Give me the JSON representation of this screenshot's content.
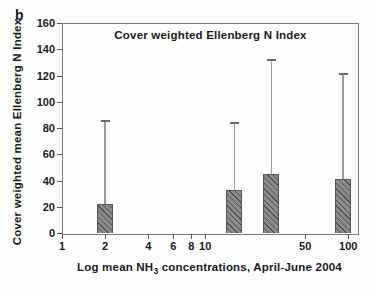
{
  "figure": {
    "panel_label": "b",
    "title": "Cover weighted Ellenberg N Index",
    "y_axis_label": "Cover weighted mean Ellenberg N Index",
    "x_axis_label_prefix": "Log mean NH",
    "x_axis_label_sub": "3",
    "x_axis_label_suffix": " concentrations, April-June 2004"
  },
  "chart_data": {
    "type": "bar",
    "title": "Cover weighted Ellenberg N Index",
    "xlabel": "Log mean NH3 concentrations, April-June 2004",
    "ylabel": "Cover weighted mean Ellenberg N Index",
    "x_scale": "log",
    "xlim": [
      1,
      115
    ],
    "ylim": [
      0,
      160
    ],
    "x_ticks": [
      1,
      2,
      4,
      6,
      8,
      10,
      50,
      100
    ],
    "y_ticks": [
      0,
      20,
      40,
      60,
      80,
      100,
      120,
      140,
      160
    ],
    "grid": false,
    "legend": null,
    "bar_width_px": 16,
    "bars": [
      {
        "x": 2,
        "mean": 22,
        "upper_error_top": 85
      },
      {
        "x": 16,
        "mean": 33,
        "upper_error_top": 84
      },
      {
        "x": 29,
        "mean": 45,
        "upper_error_top": 132
      },
      {
        "x": 92,
        "mean": 41,
        "upper_error_top": 121
      }
    ],
    "colors": {
      "bar_fill": "#8d8d8d",
      "bar_hatch": "#4f4f4f",
      "bar_border": "#555555",
      "error_line": "#9a9a9a",
      "error_cap": "#6a6a6a",
      "frame": "#7a7a7a",
      "text": "#1a1a1a"
    }
  }
}
